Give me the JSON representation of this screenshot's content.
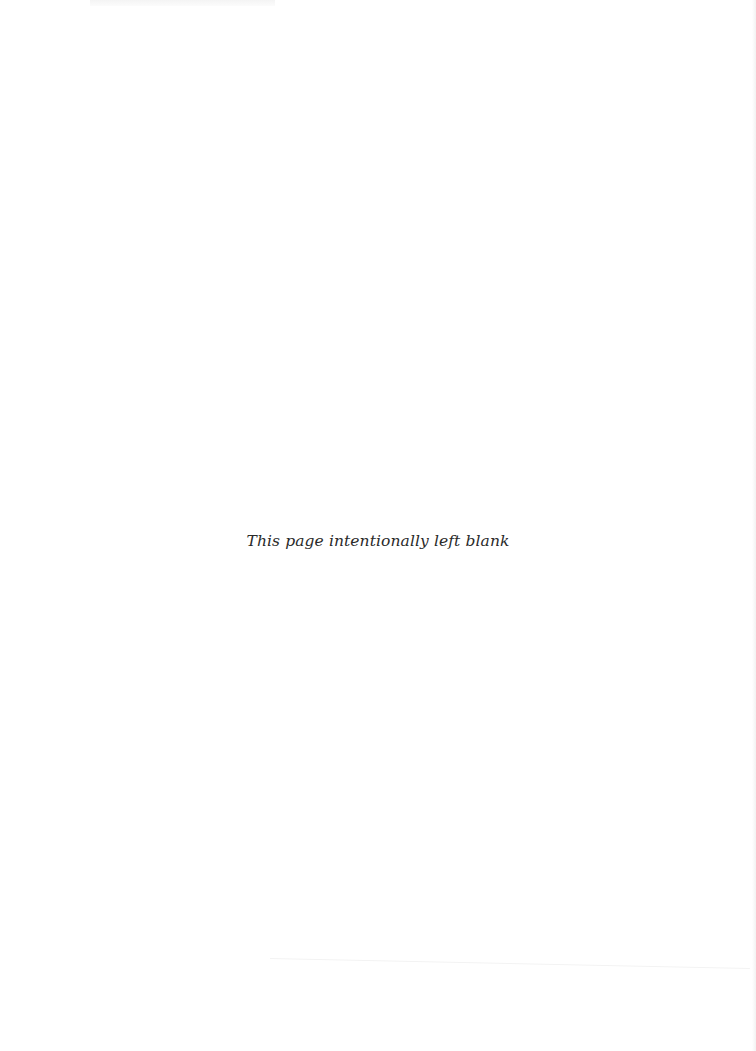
{
  "page": {
    "notice": "This page intentionally left blank",
    "background_color": "#ffffff",
    "text_color": "#2a2a2a"
  }
}
